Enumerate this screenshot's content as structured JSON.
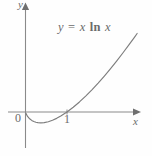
{
  "figure": {
    "equation_label": {
      "lhs": "y",
      "operator": "=",
      "coefficient": "x",
      "function": "ln",
      "argument": "x",
      "full_text": "y = x ln x"
    },
    "axis_labels": {
      "x": "x",
      "y": "y"
    },
    "origin_label": "0",
    "tick_labels": {
      "x": [
        "1"
      ]
    },
    "colors": {
      "background": "#fefefe",
      "axis": "#8a8a8a",
      "curve": "#7d7d7d",
      "text": "#6b6b6b"
    }
  },
  "chart_data": {
    "type": "line",
    "title": "",
    "subtitle": "",
    "annotations": [
      {
        "text": "y = x ln x",
        "x": 2.6,
        "y": 2.35
      }
    ],
    "xlabel": "x",
    "ylabel": "y",
    "xlim": [
      -0.45,
      2.7
    ],
    "ylim": [
      -0.85,
      2.85
    ],
    "grid": false,
    "legend": null,
    "xticks": [
      1
    ],
    "xticklabels": [
      "1"
    ],
    "yticks": [],
    "yticklabels": [],
    "origin_label": "0",
    "series": [
      {
        "name": "y = x ln x",
        "equation": "y = x*ln(x)",
        "x_intercept": 1,
        "minimum": {
          "x": 0.3679,
          "y": -0.3679
        },
        "x": [
          0.01,
          0.05,
          0.1,
          0.15,
          0.2,
          0.25,
          0.3,
          0.3679,
          0.45,
          0.55,
          0.65,
          0.75,
          0.85,
          1.0,
          1.15,
          1.3,
          1.45,
          1.6,
          1.75,
          1.9,
          2.05,
          2.2,
          2.35,
          2.5,
          2.62
        ],
        "y": [
          -0.046,
          -0.15,
          -0.23,
          -0.285,
          -0.322,
          -0.347,
          -0.361,
          -0.368,
          -0.359,
          -0.329,
          -0.28,
          -0.216,
          -0.138,
          0.0,
          0.161,
          0.341,
          0.539,
          0.752,
          0.979,
          1.22,
          1.472,
          1.735,
          2.008,
          2.291,
          2.522
        ]
      }
    ]
  }
}
